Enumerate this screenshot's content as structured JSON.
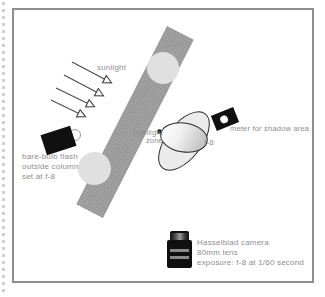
{
  "diagram": {
    "title_hint": "photography lighting setup diagram",
    "sunlight_label": "sunlight",
    "flash_label": {
      "line1": "bare-bulb flash",
      "line2": "outside column",
      "line3": "set at f-8"
    },
    "highlight_label": {
      "line1": "highlight",
      "line2": "zone"
    },
    "subject_aperture_label": "f-8",
    "meter_label": "meter for shadow area",
    "camera_label": {
      "line1": "Hasselblad camera",
      "line2": "80mm lens",
      "line3": "exposure: f-8 at 1/60 second"
    },
    "colors": {
      "column_gray": "#a0a0a0",
      "column_circle_gray": "#e0e0e0",
      "caption_text_gray": "#8e8e8e",
      "arrow_gray": "#4a4a4a",
      "device_black": "#101010",
      "frame_border_gray": "#8f8f8f",
      "subject_fill_light": "#ebebeb",
      "subject_highlight_white": "#ffffff",
      "subject_shade_gray": "#c4c4c4"
    }
  }
}
